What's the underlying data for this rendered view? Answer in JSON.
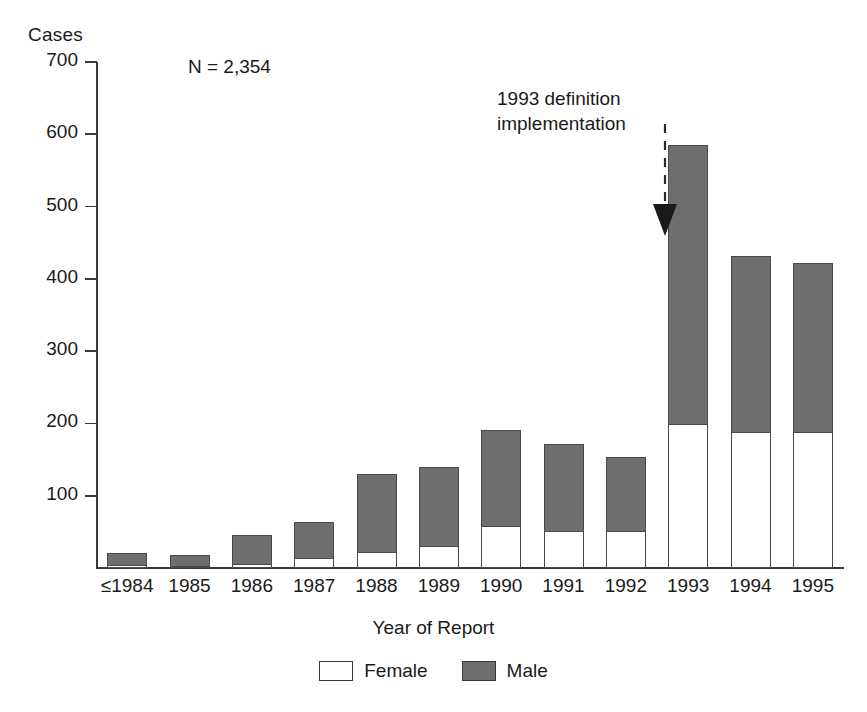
{
  "chart_data": {
    "type": "bar",
    "subtype": "stacked-vertical",
    "title": "",
    "ylabel": "Cases",
    "xlabel": "Year of Report",
    "ylim": [
      0,
      700
    ],
    "yticks": [
      0,
      100,
      200,
      300,
      400,
      500,
      600,
      700
    ],
    "ytick_labels": [
      "",
      "100",
      "200",
      "300",
      "400",
      "500",
      "600",
      "700"
    ],
    "grid": false,
    "legend_position": "bottom-center",
    "categories": [
      "≤1984",
      "1985",
      "1986",
      "1987",
      "1988",
      "1989",
      "1990",
      "1991",
      "1992",
      "1993",
      "1994",
      "1995"
    ],
    "series": [
      {
        "name": "Female",
        "color": "#ffffff",
        "values": [
          4,
          3,
          6,
          14,
          22,
          31,
          58,
          52,
          52,
          200,
          188,
          189
        ]
      },
      {
        "name": "Male",
        "color": "#6e6e6e",
        "values": [
          18,
          17,
          42,
          52,
          110,
          110,
          135,
          121,
          103,
          387,
          246,
          234
        ]
      }
    ],
    "totals": [
      22,
      20,
      48,
      66,
      132,
      141,
      193,
      173,
      155,
      587,
      434,
      423
    ],
    "annotations": [
      {
        "name": "sample-size",
        "text": "N = 2,354"
      },
      {
        "name": "definition-change",
        "text_line1": "1993 definition",
        "text_line2": "implementation",
        "arrow": "down-dashed",
        "points_to": "1993"
      }
    ]
  },
  "axis": {
    "y_title": "Cases",
    "x_title": "Year of Report",
    "y_ticks": [
      {
        "value": 700,
        "label": "700"
      },
      {
        "value": 600,
        "label": "600"
      },
      {
        "value": 500,
        "label": "500"
      },
      {
        "value": 400,
        "label": "400"
      },
      {
        "value": 300,
        "label": "300"
      },
      {
        "value": 200,
        "label": "200"
      },
      {
        "value": 100,
        "label": "100"
      }
    ]
  },
  "annotation": {
    "sample_size": "N = 2,354",
    "callout_line1": "1993 definition",
    "callout_line2": "implementation"
  },
  "legend": {
    "items": [
      {
        "label": "Female",
        "swatch": "female"
      },
      {
        "label": "Male",
        "swatch": "male"
      }
    ]
  }
}
